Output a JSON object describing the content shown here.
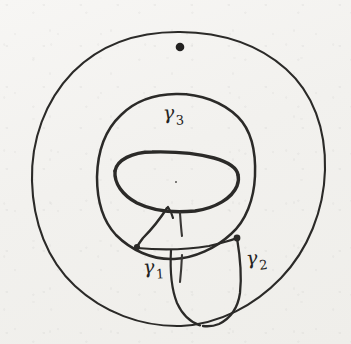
{
  "figure": {
    "kind": "hand-drawn-mathematical-diagram",
    "width": 351,
    "height": 344,
    "background_color": "#f2f1ee",
    "ink_color": "#2b2a28"
  },
  "labels": [
    {
      "name": "gamma-3",
      "glyph": "γ",
      "subscript": "3",
      "x": 163,
      "y": 103
    },
    {
      "name": "gamma-1",
      "glyph": "γ",
      "subscript": "1",
      "x": 143,
      "y": 257
    },
    {
      "name": "gamma-2",
      "glyph": "γ",
      "subscript": "2",
      "x": 246,
      "y": 248
    }
  ],
  "shapes": {
    "outer_circle": {
      "cx": 178,
      "cy": 179,
      "r": 147,
      "stroke_width": 2.0
    },
    "inner_circle": {
      "cx": 176,
      "cy": 180,
      "r": 79,
      "stroke_width": 2.3
    },
    "hole_ellipse": {
      "cx": 176,
      "cy": 182,
      "rx": 62,
      "ry": 30,
      "stroke_width": 3.0
    }
  },
  "points": [
    {
      "name": "base-point",
      "x": 180,
      "y": 47,
      "r": 4.2,
      "note": "filled basepoint dot on outer circle interior near top"
    },
    {
      "name": "center-dot",
      "x": 176,
      "y": 182,
      "r": 0.9,
      "note": "faint dot at centre of hole ellipse"
    },
    {
      "name": "junction-gamma1",
      "x": 137,
      "y": 247,
      "r": 3.2
    },
    {
      "name": "junction-gamma2",
      "x": 237,
      "y": 238,
      "r": 3.4
    }
  ],
  "loops": [
    {
      "name": "gamma-1-arc",
      "style": "solid",
      "description": "short arc from hole ellipse bottom down-left to junction on inner circle"
    },
    {
      "name": "gamma-2-arc",
      "style": "solid",
      "description": "long arc from junction on inner circle right side sweeping down to the outer circle bottom"
    },
    {
      "name": "gamma-3-arc",
      "style": "solid",
      "description": "the inner circle itself, labelled near its top"
    },
    {
      "name": "hidden-arc-upper",
      "style": "dashed",
      "description": "short dashed stroke below hole ellipse indicating hidden part of loop"
    },
    {
      "name": "hidden-arc-lower",
      "style": "dashed",
      "description": "dashed stroke continuing downward behind the surface"
    }
  ]
}
